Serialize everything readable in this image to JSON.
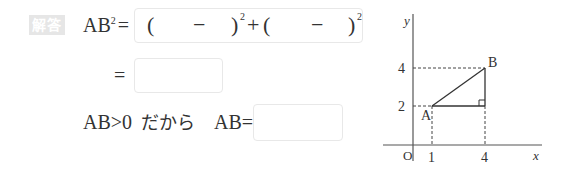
{
  "badge": {
    "label": "解答"
  },
  "line1": {
    "lhs": "AB",
    "lhs_exp": "2",
    "equals": "=",
    "expression": {
      "open1": "(",
      "minus1": "−",
      "close1": ")",
      "exp1": "2",
      "plus": "+",
      "open2": "(",
      "minus2": "−",
      "close2": ")",
      "exp2": "2"
    }
  },
  "line2": {
    "equals": "=",
    "answer_value": ""
  },
  "line3": {
    "condition": "AB>0",
    "connector": "だから",
    "lhs": "AB",
    "equals": "=",
    "answer_value": ""
  },
  "graph": {
    "y_axis_label": "y",
    "x_axis_label": "x",
    "origin_label": "O",
    "y_ticks": [
      "4",
      "2"
    ],
    "x_ticks": [
      "1",
      "4"
    ],
    "point_a": {
      "label": "A",
      "x": 1,
      "y": 2
    },
    "point_b": {
      "label": "B",
      "x": 4,
      "y": 4
    }
  }
}
